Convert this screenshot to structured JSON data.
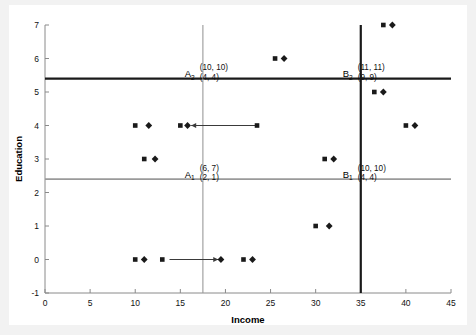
{
  "figure": {
    "background_color": "#f2f2f2",
    "panel_color": "#ffffff"
  },
  "chart_data": {
    "type": "scatter",
    "title": "",
    "xlabel": "Income",
    "ylabel": "Education",
    "xlim": [
      0,
      45
    ],
    "ylim": [
      -1,
      7
    ],
    "xticks": [
      0,
      5,
      10,
      15,
      20,
      25,
      30,
      35,
      40,
      45
    ],
    "xticklabels": [
      "0",
      "5",
      "10",
      "15",
      "20",
      "25",
      "30",
      "35",
      "40",
      "45"
    ],
    "yticks": [
      -1,
      0,
      1,
      2,
      3,
      4,
      5,
      6,
      7
    ],
    "yticklabels": [
      "-1",
      "0",
      "1",
      "2",
      "3",
      "4",
      "5",
      "6",
      "7"
    ],
    "grid": false,
    "legend": "none",
    "series": [
      {
        "name": "square",
        "marker": "square",
        "color": "#1a1a1a",
        "points": [
          [
            10.0,
            4
          ],
          [
            15.0,
            4
          ],
          [
            23.5,
            4
          ],
          [
            40.0,
            4
          ],
          [
            11.0,
            3
          ],
          [
            31.0,
            3
          ],
          [
            36.5,
            5
          ],
          [
            25.5,
            6
          ],
          [
            37.5,
            7
          ],
          [
            10.0,
            0
          ],
          [
            13.0,
            0
          ],
          [
            22.0,
            0
          ],
          [
            30.0,
            1
          ]
        ]
      },
      {
        "name": "diamond",
        "marker": "diamond",
        "color": "#1a1a1a",
        "points": [
          [
            11.5,
            4
          ],
          [
            15.8,
            4
          ],
          [
            41.0,
            4
          ],
          [
            12.2,
            3
          ],
          [
            32.0,
            3
          ],
          [
            37.5,
            5
          ],
          [
            26.5,
            6
          ],
          [
            38.5,
            7
          ],
          [
            11.0,
            0
          ],
          [
            19.5,
            0
          ],
          [
            23.0,
            0
          ],
          [
            31.5,
            1
          ]
        ]
      }
    ],
    "reference_lines": [
      {
        "name": "A2-horizontal",
        "orientation": "horizontal",
        "value": 5.4,
        "style": "dark"
      },
      {
        "name": "A1-horizontal",
        "orientation": "horizontal",
        "value": 2.4,
        "style": "light"
      },
      {
        "name": "B-vertical-dark",
        "orientation": "vertical",
        "value": 35.0,
        "style": "dark"
      },
      {
        "name": "A-vertical-light",
        "orientation": "vertical",
        "value": 17.5,
        "style": "light"
      }
    ],
    "arrows": [
      {
        "name": "arrow-education-left",
        "x_start": 23.5,
        "x_end": 16.2,
        "y": 4,
        "direction": "left"
      },
      {
        "name": "arrow-income-right",
        "x_start": 13.8,
        "x_end": 19.2,
        "y": 0,
        "direction": "right"
      }
    ],
    "annotations": [
      {
        "name": "quadrant-label-A2",
        "label": "A",
        "subscript": "2",
        "x": 16.6,
        "y": 5.62,
        "values": [
          "(10, 10)",
          "(4, 4)"
        ]
      },
      {
        "name": "quadrant-label-A1",
        "label": "A",
        "subscript": "1",
        "x": 16.6,
        "y": 2.62,
        "values": [
          "(6, 7)",
          "(2, 1)"
        ]
      },
      {
        "name": "quadrant-label-B2",
        "label": "B",
        "subscript": "2",
        "x": 34.1,
        "y": 5.62,
        "values": [
          "(11, 11)",
          "(9, 9)"
        ]
      },
      {
        "name": "quadrant-label-B1",
        "label": "B",
        "subscript": "1",
        "x": 34.1,
        "y": 2.62,
        "values": [
          "(10, 10)",
          "(4, 4)"
        ]
      }
    ]
  }
}
